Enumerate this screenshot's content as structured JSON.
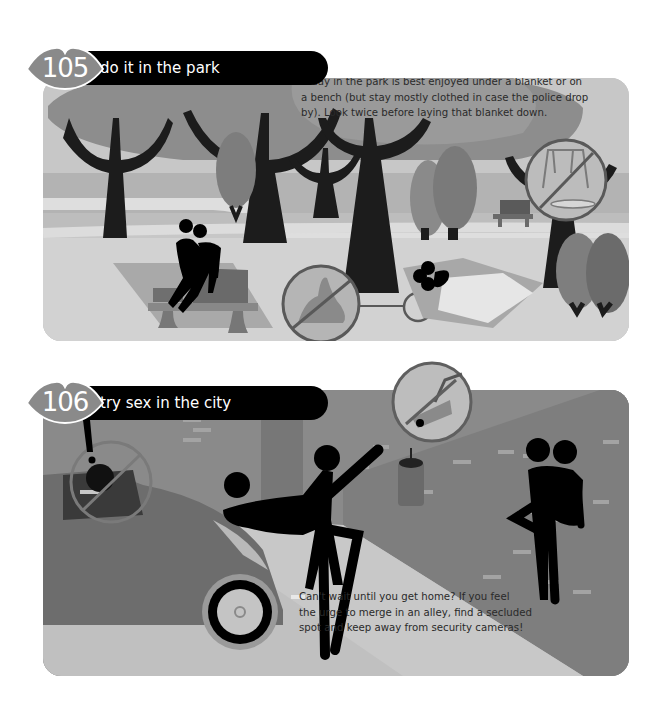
{
  "entries": [
    {
      "number": "105",
      "title": "do it in the park",
      "caption_lines": [
        "A day in the park is best enjoyed under a blanket or on",
        "a bench (but stay mostly clothed in case the police drop",
        "by). Look twice before laying that blanket down."
      ],
      "scene": "park",
      "warning_icons": [
        "no-dog-poop-icon",
        "no-playground-icon"
      ]
    },
    {
      "number": "106",
      "title": "try sex in the city",
      "caption_lines": [
        "Can't wait until you get home? If you feel",
        "the urge to merge in an alley, find a secluded",
        "spot and keep away from security cameras!"
      ],
      "scene": "city-alley",
      "warning_icons": [
        "no-car-window-peeping-icon",
        "security-camera-icon"
      ],
      "exclamation": "!"
    }
  ],
  "colors": {
    "badge": "#8a8a8a",
    "title_bar": "#000000",
    "title_text": "#ffffff",
    "figure": "#000000",
    "park_bg": "#c3c3c3",
    "city_bg": "#8e8e8e"
  }
}
